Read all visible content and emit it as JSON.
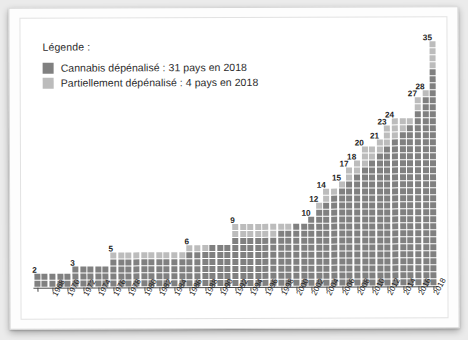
{
  "legend": {
    "title": "Légende :",
    "items": [
      {
        "label": "Cannabis dépénalisé : 31 pays en 2018",
        "color": "#808080",
        "swatch_name": "legend-swatch-decriminalized"
      },
      {
        "label": "Partiellement dépénalisé : 4 pays en 2018",
        "color": "#bcbcbc",
        "swatch_name": "legend-swatch-partial"
      }
    ]
  },
  "colors": {
    "full": "#808080",
    "partial": "#bcbcbc",
    "axis": "#4a4a4a",
    "text": "#1f1f1f",
    "paper": "#ffffff",
    "background": "#ebebeb"
  },
  "axis": {
    "tick_labels": [
      "1968",
      "1970",
      "1972",
      "1974",
      "1976",
      "1978",
      "1980",
      "1982",
      "1984",
      "1986",
      "1988",
      "1990",
      "1992",
      "1994",
      "1996",
      "1998",
      "2000",
      "2002",
      "2004",
      "2006",
      "2008",
      "2010",
      "2012",
      "2014",
      "2016",
      "2018"
    ],
    "tick_step_years": 2,
    "first_year": 1966,
    "last_year": 2018
  },
  "chart_data": {
    "type": "bar",
    "title": "",
    "subtitle": "",
    "xlabel": "",
    "ylabel": "",
    "ylim": [
      0,
      36
    ],
    "grid": false,
    "legend_position": "top-left",
    "note": "Waffle-style stacked columns; each square = 1 country. One column per year from 1966 to 2018.",
    "categories": [
      1966,
      1967,
      1968,
      1969,
      1970,
      1971,
      1972,
      1973,
      1974,
      1975,
      1976,
      1977,
      1978,
      1979,
      1980,
      1981,
      1982,
      1983,
      1984,
      1985,
      1986,
      1987,
      1988,
      1989,
      1990,
      1991,
      1992,
      1993,
      1994,
      1995,
      1996,
      1997,
      1998,
      1999,
      2000,
      2001,
      2002,
      2003,
      2004,
      2005,
      2006,
      2007,
      2008,
      2009,
      2010,
      2011,
      2012,
      2013,
      2014,
      2015,
      2016,
      2017,
      2018
    ],
    "series": [
      {
        "name": "Cannabis dépénalisé",
        "values": [
          2,
          2,
          2,
          2,
          2,
          3,
          3,
          3,
          3,
          3,
          4,
          4,
          4,
          4,
          4,
          4,
          4,
          4,
          4,
          4,
          5,
          5,
          5,
          6,
          6,
          6,
          7,
          7,
          7,
          7,
          7,
          7,
          8,
          8,
          9,
          9,
          10,
          11,
          12,
          13,
          14,
          15,
          16,
          17,
          18,
          19,
          20,
          21,
          22,
          23,
          25,
          27,
          31
        ]
      },
      {
        "name": "Partiellement dépénalisé",
        "values": [
          0,
          0,
          0,
          0,
          0,
          0,
          0,
          0,
          0,
          0,
          1,
          1,
          1,
          1,
          1,
          1,
          1,
          1,
          1,
          1,
          1,
          1,
          1,
          0,
          0,
          0,
          2,
          2,
          2,
          2,
          2,
          2,
          1,
          1,
          0,
          0,
          0,
          1,
          2,
          1,
          1,
          2,
          2,
          3,
          2,
          2,
          3,
          3,
          2,
          1,
          2,
          1,
          4
        ]
      }
    ],
    "totals": [
      2,
      2,
      2,
      2,
      2,
      3,
      3,
      3,
      3,
      3,
      5,
      5,
      5,
      5,
      5,
      5,
      5,
      5,
      5,
      5,
      6,
      6,
      6,
      6,
      6,
      6,
      9,
      9,
      9,
      9,
      9,
      9,
      9,
      9,
      9,
      9,
      10,
      12,
      14,
      14,
      15,
      17,
      18,
      20,
      20,
      21,
      23,
      24,
      24,
      24,
      27,
      28,
      35
    ],
    "labels": [
      {
        "year": 1966,
        "value": 2
      },
      {
        "year": 1971,
        "value": 3
      },
      {
        "year": 1976,
        "value": 5
      },
      {
        "year": 1986,
        "value": 6
      },
      {
        "year": 1992,
        "value": 7
      },
      {
        "year": 1992,
        "value": 9
      },
      {
        "year": 2002,
        "value": 10
      },
      {
        "year": 2004,
        "value": 12
      },
      {
        "year": 2006,
        "value": 14
      },
      {
        "year": 2007,
        "value": 15
      },
      {
        "year": 2008,
        "value": 17
      },
      {
        "year": 2009,
        "value": 18
      },
      {
        "year": 2010,
        "value": 20
      },
      {
        "year": 2011,
        "value": 21
      },
      {
        "year": 2012,
        "value": 23
      },
      {
        "year": 2013,
        "value": 24
      },
      {
        "year": 2015,
        "value": 27
      },
      {
        "year": 2016,
        "value": 28
      },
      {
        "year": 2017,
        "value": 31
      },
      {
        "year": 2017,
        "value": 33
      },
      {
        "year": 2018,
        "value": 35
      }
    ],
    "visible_value_labels": [
      "2",
      "3",
      "5",
      "6",
      "7",
      "9",
      "10",
      "12",
      "14",
      "15",
      "17",
      "18",
      "20",
      "21",
      "23",
      "24",
      "27",
      "28",
      "31",
      "33",
      "35"
    ]
  }
}
